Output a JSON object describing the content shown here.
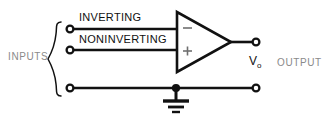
{
  "diagram": {
    "type": "circuit-schematic",
    "canvas": {
      "width": 328,
      "height": 118,
      "background": "#ffffff"
    },
    "colors": {
      "wire": "#111111",
      "label_dark": "#111111",
      "label_gray": "#8a8a8a",
      "sign": "#6f6f6f",
      "terminal_fill": "#ffffff"
    },
    "labels": {
      "inverting": "INVERTING",
      "noninverting": "NONINVERTING",
      "inputs": "INPUTS",
      "output": "OUTPUT",
      "output_voltage": "V",
      "output_voltage_subscript": "o"
    },
    "amplifier": {
      "symbol": "triangle",
      "inverting_sign": "−",
      "noninverting_sign": "+"
    },
    "terminals": [
      {
        "name": "inverting-input-terminal",
        "x": 70,
        "y": 29
      },
      {
        "name": "noninverting-input-terminal",
        "x": 70,
        "y": 50
      },
      {
        "name": "ground-input-terminal",
        "x": 70,
        "y": 88
      },
      {
        "name": "output-terminal",
        "x": 256,
        "y": 42
      }
    ],
    "ground": {
      "name": "ground-symbol",
      "x": 176,
      "y": 88
    }
  }
}
